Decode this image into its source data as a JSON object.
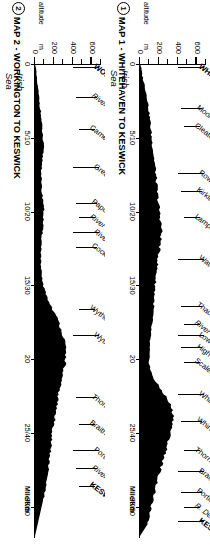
{
  "page": {
    "orientation_note": "rotated-180",
    "ink": "#000000",
    "paper": "#ffffff"
  },
  "maps": [
    {
      "number": "1",
      "title": "MAP 1 - WHITEHAVEN TO KESWICK",
      "sea_label_line1": "Irish",
      "sea_label_line2": "Sea",
      "altitude_axis_label": "altitude",
      "altitude_unit": "m",
      "distance_axis_label": "Mile/Km",
      "y_ticks": [
        "0",
        "200",
        "400",
        "600"
      ],
      "x_ticks": [
        {
          "mile": "0",
          "km": ""
        },
        {
          "mile": "5",
          "km": "10"
        },
        {
          "mile": "10",
          "km": "20"
        },
        {
          "mile": "15",
          "km": "30"
        },
        {
          "mile": "20",
          "km": ""
        },
        {
          "mile": "25",
          "km": "40"
        },
        {
          "mile": "30",
          "km": "50"
        }
      ],
      "places": [
        "WHITEHAVEN",
        "Moor Row",
        "Cleator Moor",
        "Rowrah",
        "Kirkland",
        "Lamplugh",
        "Waterend",
        "Thackthwaite",
        "River Cocker",
        "Low Lorton",
        "High Lorton",
        "Scales",
        "Whinlatter Pass",
        "Whinlatter Forest",
        "Thornthwaite",
        "Braithwaite",
        "Portinscale",
        "R. Derwent",
        "KESWICK"
      ]
    },
    {
      "number": "2",
      "title": "MAP 2 - WORKINGTON TO KESWICK",
      "sea_label_line1": "Irish",
      "sea_label_line2": "Sea",
      "altitude_axis_label": "altitude",
      "altitude_unit": "m",
      "distance_axis_label": "Mile/Km",
      "y_ticks": [
        "0",
        "200",
        "400",
        "600"
      ],
      "x_ticks": [
        {
          "mile": "0",
          "km": ""
        },
        {
          "mile": "5",
          "km": "10"
        },
        {
          "mile": "10",
          "km": "20"
        },
        {
          "mile": "15",
          "km": "30"
        },
        {
          "mile": "20",
          "km": ""
        },
        {
          "mile": "25",
          "km": "40"
        },
        {
          "mile": "30",
          "km": "50"
        }
      ],
      "places": [
        "WORKINGTON",
        "River Derwent",
        "Camerton",
        "Great Broughton",
        "Papcastle",
        "River Derwent",
        "River Cocker",
        "Cockermouth",
        "Wythop Mill",
        "Wythop Woods",
        "Thornthwaite",
        "Braithwaite",
        "Portinscale",
        "River Derwent",
        "KESWICK"
      ]
    }
  ],
  "chart_data": [
    {
      "type": "area",
      "title": "MAP 1 - WHITEHAVEN TO KESWICK",
      "xlabel": "Mile/Km",
      "ylabel": "altitude m",
      "xlim": [
        0,
        32
      ],
      "ylim": [
        0,
        700
      ],
      "x_unit_primary": "mile",
      "x_unit_secondary": "km",
      "grid": false,
      "legend": "none",
      "x": [
        0,
        0.8,
        1.6,
        2.4,
        3.2,
        4.0,
        4.8,
        5.6,
        6.4,
        7.2,
        8.0,
        8.8,
        9.6,
        10.4,
        11.2,
        12.0,
        12.8,
        13.6,
        14.4,
        15.2,
        16.0,
        16.8,
        17.6,
        18.4,
        19.2,
        20.0,
        20.8,
        21.6,
        22.4,
        23.2,
        24.0,
        24.8,
        25.6,
        26.4,
        27.2,
        28.0,
        28.8,
        29.6,
        30.4,
        31.2
      ],
      "y": [
        5,
        25,
        55,
        80,
        95,
        110,
        120,
        135,
        150,
        165,
        175,
        185,
        200,
        215,
        230,
        220,
        200,
        185,
        170,
        160,
        150,
        140,
        125,
        110,
        100,
        95,
        110,
        170,
        260,
        330,
        360,
        330,
        300,
        270,
        230,
        195,
        165,
        135,
        105,
        80
      ],
      "annotations": [
        {
          "label": "WHITEHAVEN",
          "x": 0.2
        },
        {
          "label": "Moor Row",
          "x": 3.0
        },
        {
          "label": "Cleator Moor",
          "x": 4.2
        },
        {
          "label": "Rowrah",
          "x": 7.4
        },
        {
          "label": "Kirkland",
          "x": 8.6
        },
        {
          "label": "Lamplugh",
          "x": 10.4
        },
        {
          "label": "Waterend",
          "x": 13.2
        },
        {
          "label": "Thackthwaite",
          "x": 16.4
        },
        {
          "label": "River Cocker",
          "x": 17.6
        },
        {
          "label": "Low Lorton",
          "x": 18.4
        },
        {
          "label": "High Lorton",
          "x": 19.2
        },
        {
          "label": "Scales",
          "x": 20.2
        },
        {
          "label": "Whinlatter Pass",
          "x": 22.4
        },
        {
          "label": "Whinlatter Forest",
          "x": 24.2
        },
        {
          "label": "Thornthwaite",
          "x": 26.2
        },
        {
          "label": "Braithwaite",
          "x": 27.6
        },
        {
          "label": "Portinscale",
          "x": 29.0
        },
        {
          "label": "R. Derwent",
          "x": 30.0
        },
        {
          "label": "KESWICK",
          "x": 31.0
        }
      ]
    },
    {
      "type": "area",
      "title": "MAP 2 - WORKINGTON TO KESWICK",
      "xlabel": "Mile/Km",
      "ylabel": "altitude m",
      "xlim": [
        0,
        32
      ],
      "ylim": [
        0,
        700
      ],
      "x_unit_primary": "mile",
      "x_unit_secondary": "km",
      "grid": false,
      "legend": "none",
      "x": [
        0,
        0.8,
        1.6,
        2.4,
        3.2,
        4.0,
        4.8,
        5.6,
        6.4,
        7.2,
        8.0,
        8.8,
        9.6,
        10.4,
        11.2,
        12.0,
        12.8,
        13.6,
        14.4,
        15.2,
        16.0,
        16.8,
        17.6,
        18.4,
        19.2,
        20.0,
        20.8,
        21.6,
        22.4,
        23.2,
        24.0,
        24.8,
        25.6,
        26.4,
        27.2,
        28.0,
        28.8,
        29.6
      ],
      "y": [
        5,
        15,
        30,
        45,
        60,
        70,
        80,
        90,
        80,
        70,
        65,
        75,
        95,
        90,
        80,
        70,
        65,
        60,
        70,
        95,
        140,
        200,
        260,
        300,
        320,
        330,
        300,
        270,
        250,
        230,
        210,
        190,
        175,
        160,
        145,
        130,
        110,
        85
      ],
      "annotations": [
        {
          "label": "WORKINGTON",
          "x": 0.2
        },
        {
          "label": "River Derwent",
          "x": 2.2
        },
        {
          "label": "Camerton",
          "x": 4.4
        },
        {
          "label": "Great Broughton",
          "x": 7.0
        },
        {
          "label": "Papcastle",
          "x": 9.4
        },
        {
          "label": "River Derwent",
          "x": 10.4
        },
        {
          "label": "River Cocker",
          "x": 11.4
        },
        {
          "label": "Cockermouth",
          "x": 12.4
        },
        {
          "label": "Wythop Mill",
          "x": 16.6
        },
        {
          "label": "Wythop Woods",
          "x": 18.4
        },
        {
          "label": "Thornthwaite",
          "x": 22.6
        },
        {
          "label": "Braithwaite",
          "x": 24.4
        },
        {
          "label": "Portinscale",
          "x": 26.2
        },
        {
          "label": "River Derwent",
          "x": 27.4
        },
        {
          "label": "KESWICK",
          "x": 28.6
        }
      ]
    }
  ]
}
